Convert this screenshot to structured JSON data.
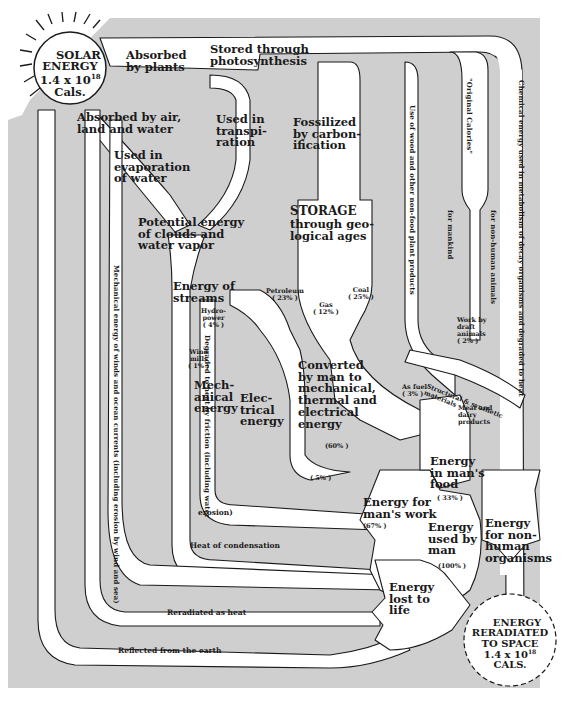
{
  "colors": {
    "background_panel": "#cfcfcf",
    "flow_path": "#ffffff",
    "outline": "#1a1a1a",
    "page": "#ffffff"
  },
  "source": {
    "title": "SOLAR\nENERGY\n1.4 x 10",
    "exponent": "18",
    "unit": "Cals."
  },
  "sink": {
    "title": "ENERGY\nRERADIATED\nTO SPACE\n1.4 x 10",
    "exponent": "18",
    "unit": "CALS."
  },
  "labels": {
    "absorbed_by_plants": "Absorbed\nby plants",
    "stored_photosynthesis": "Stored through\nphotosynthesis",
    "absorbed_air_land_water": "Absorbed by air,\nland and water",
    "used_in_transpiration": "Used in\ntranspi-\nration",
    "used_in_evaporation": "Used in\nevaporation\nof water",
    "fossilized": "Fossilized\nby carbon-\nification",
    "potential_energy_clouds": "Potential energy\nof clouds and\nwater vapor",
    "storage": "STORAGE",
    "storage_sub": "through geo-\nlogical ages",
    "energy_of_streams": "Energy of\nstreams",
    "hydropower": "Hydro-\npower\n( 4% )",
    "windmills": "Wind\nmills\n( 1% )",
    "petroleum": "Petroleum\n( 23% )",
    "gas": "Gas\n( 12% )",
    "coal": "Coal\n( 25% )",
    "mechanical_energy": "Mech-\nanical\nenergy",
    "electrical_energy": "Elec-\ntrical\nenergy",
    "converted_by_man": "Converted\nby man to\nmechanical,\nthermal and\nelectrical\nenergy",
    "converted_pct": "(60% )",
    "five_pct": "( 5% )",
    "work_by_draft_animals": "Work by\ndraft\nanimals\n( 2% )",
    "structural_synthetic": "Structural & synthetic\nmaterials",
    "as_fuel": "As fuel\n( 3% )",
    "meat_dairy": "Meat and\ndairy\nproducts",
    "energy_in_mans_food": "Energy\nin man's\nfood",
    "food_pct": "( 33% )",
    "energy_for_mans_work": "Energy for\nman's work",
    "work_pct": "(67% )",
    "energy_used_by_man": "Energy\nused by\nman",
    "used_pct": "(100% )",
    "energy_for_non_human": "Energy\nfor non-\nhuman\norganisms",
    "energy_lost_to_life": "Energy\nlost to\nlife",
    "heat_of_condensation": "Heat of condensation",
    "reradiated_as_heat": "Reradiated as heat",
    "reflected_from_earth": "Reflected from the earth",
    "erosion": "erosion)"
  },
  "vertical_labels": {
    "mechanical_winds": "Mechanical energy of winds and ocean currents (including erosion by wind and sea)",
    "degraded_friction": "Degraded to heat by friction (including water",
    "use_of_wood": "Use of wood and other non-food plant products",
    "original_calories": "\"Original Calories\"",
    "for_mankind": "for mankind",
    "for_non_human_animals": "for non-human animals",
    "chemical_energy_decay": "Chemical energy used in metabolism of decay organisms and degraded to heat"
  }
}
